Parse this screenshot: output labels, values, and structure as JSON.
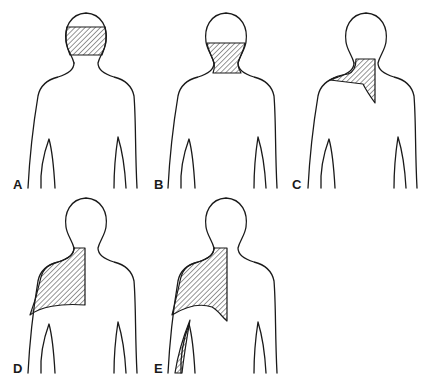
{
  "figure": {
    "line_color": "#1a1a1a",
    "background": "#ffffff",
    "panels": [
      {
        "label": "A",
        "shaded_region": "band across head (mid head)"
      },
      {
        "label": "B",
        "shaded_region": "lower head and neck"
      },
      {
        "label": "C",
        "shaded_region": "right side of neck and top of shoulder, tapering down between shoulder blades"
      },
      {
        "label": "D",
        "shaded_region": "right shoulder and upper back to midline"
      },
      {
        "label": "E",
        "shaded_region": "right shoulder and upper back to midline plus inner arm strip"
      }
    ]
  }
}
